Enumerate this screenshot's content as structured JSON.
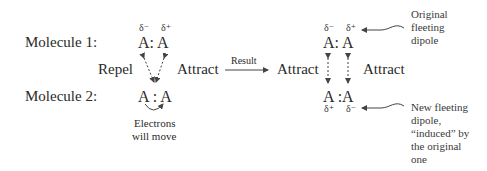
{
  "diagram": {
    "molecule1_label": "Molecule 1:",
    "molecule2_label": "Molecule 2:",
    "left": {
      "top_deltas": [
        "δ⁻",
        "δ⁺"
      ],
      "top_molecule": "A: A",
      "bottom_molecule": "A : A",
      "repel_label": "Repel",
      "attract_label": "Attract",
      "electron_note_line1": "Electrons",
      "electron_note_line2": "will move"
    },
    "result_arrow_label": "Result",
    "right": {
      "attract_left_label": "Attract",
      "attract_right_label": "Attract",
      "top_deltas": [
        "δ⁻",
        "δ⁺"
      ],
      "top_molecule": "A: A",
      "bottom_molecule": "A :A",
      "bottom_deltas": [
        "δ⁺",
        "δ⁻"
      ],
      "original_dipole_note": [
        "Original",
        "fleeting",
        "dipole"
      ],
      "induced_dipole_note": [
        "New fleeting",
        "dipole,",
        "“induced” by",
        "the original",
        "one"
      ]
    },
    "colors": {
      "text": "#2a2a2a",
      "arrows": "#444444"
    }
  }
}
